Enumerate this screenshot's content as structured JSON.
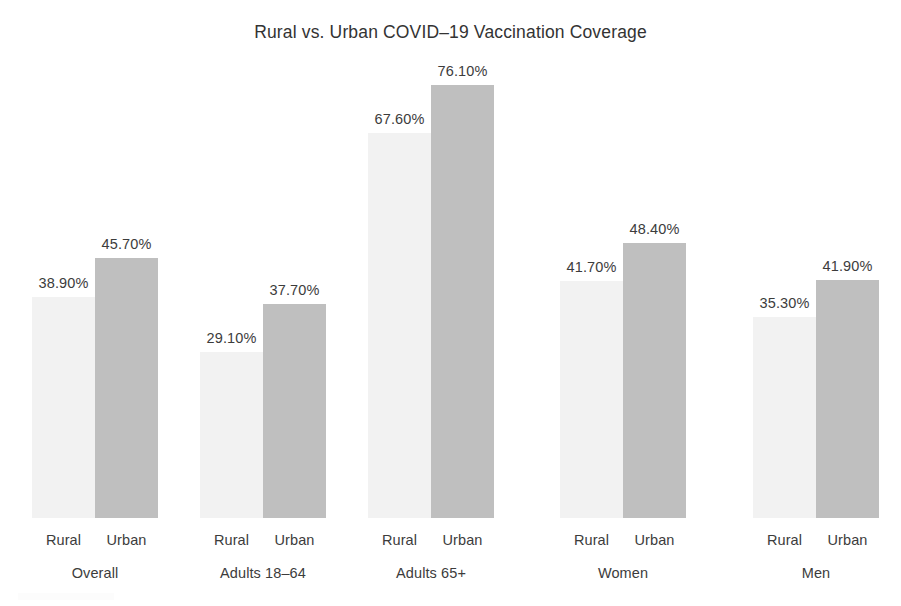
{
  "chart_data": {
    "type": "bar",
    "title": "Rural vs. Urban COVID–19 Vaccination Coverage",
    "xlabel": "",
    "ylabel": "",
    "ylim": [
      0,
      80
    ],
    "grid": false,
    "legend": "none",
    "value_suffix": "%",
    "categories": [
      "Overall",
      "Adults 18–64",
      "Adults 65+",
      "Women",
      "Men"
    ],
    "series": [
      {
        "name": "Rural",
        "color": "#f2f2f2",
        "values": [
          38.9,
          29.1,
          67.6,
          41.7,
          35.3
        ],
        "labels": [
          "38.90%",
          "29.10%",
          "67.60%",
          "41.70%",
          "35.30%"
        ]
      },
      {
        "name": "Urban",
        "color": "#bfbfbf",
        "values": [
          45.7,
          37.7,
          76.1,
          48.4,
          41.9
        ],
        "labels": [
          "45.70%",
          "37.70%",
          "76.10%",
          "48.40%",
          "41.90%"
        ]
      }
    ],
    "groups": [
      {
        "label": "Overall",
        "bars": [
          {
            "tick": "Rural",
            "value": 38.9,
            "label": "38.90%",
            "series": "Rural"
          },
          {
            "tick": "Urban",
            "value": 45.7,
            "label": "45.70%",
            "series": "Urban"
          }
        ]
      },
      {
        "label": "Adults 18–64",
        "bars": [
          {
            "tick": "Rural",
            "value": 29.1,
            "label": "29.10%",
            "series": "Rural"
          },
          {
            "tick": "Urban",
            "value": 37.7,
            "label": "37.70%",
            "series": "Urban"
          }
        ]
      },
      {
        "label": "Adults 65+",
        "bars": [
          {
            "tick": "Rural",
            "value": 67.6,
            "label": "67.60%",
            "series": "Rural"
          },
          {
            "tick": "Urban",
            "value": 76.1,
            "label": "76.10%",
            "series": "Urban"
          }
        ]
      },
      {
        "label": "Women",
        "bars": [
          {
            "tick": "Rural",
            "value": 41.7,
            "label": "41.70%",
            "series": "Rural"
          },
          {
            "tick": "Urban",
            "value": 48.4,
            "label": "48.40%",
            "series": "Urban"
          }
        ]
      },
      {
        "label": "Men",
        "bars": [
          {
            "tick": "Rural",
            "value": 35.3,
            "label": "35.30%",
            "series": "Rural"
          },
          {
            "tick": "Urban",
            "value": 41.9,
            "label": "41.90%",
            "series": "Urban"
          }
        ]
      }
    ]
  }
}
